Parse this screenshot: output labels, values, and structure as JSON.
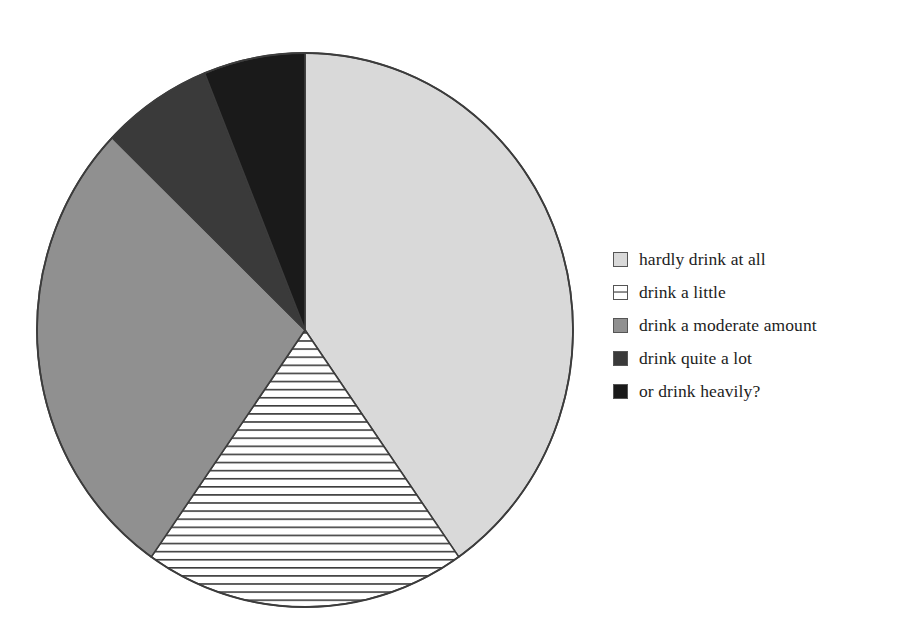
{
  "chart_data": {
    "type": "pie",
    "title": "",
    "subtitle": "",
    "xlabel": "",
    "ylabel": "",
    "grid": false,
    "legend_position": "right",
    "start_angle_deg": 0,
    "direction": "clockwise",
    "categories": [
      "hardly drink at all",
      "drink a little",
      "drink a moderate amount",
      "drink quite a lot",
      "or drink heavily?"
    ],
    "values": [
      40.3,
      19.4,
      27.5,
      6.7,
      6.1
    ],
    "units": "percent",
    "slices": [
      {
        "label": "hardly drink at all",
        "value": 40.3,
        "start_angle_deg": 0,
        "end_angle_deg": 145,
        "fill": "#d9d9d9",
        "pattern": "solid",
        "swatch_name": "legend-swatch-hardly-drink-at-all"
      },
      {
        "label": "drink a little",
        "value": 19.4,
        "start_angle_deg": 145,
        "end_angle_deg": 215,
        "fill": "#ffffff",
        "pattern": "horizontal-lines",
        "swatch_name": "legend-swatch-drink-a-little"
      },
      {
        "label": "drink a moderate amount",
        "value": 27.5,
        "start_angle_deg": 215,
        "end_angle_deg": 314,
        "fill": "#909090",
        "pattern": "solid",
        "swatch_name": "legend-swatch-drink-a-moderate-amount"
      },
      {
        "label": "drink quite a lot",
        "value": 6.7,
        "start_angle_deg": 314,
        "end_angle_deg": 338,
        "fill": "#3a3a3a",
        "pattern": "solid",
        "swatch_name": "legend-swatch-drink-quite-a-lot"
      },
      {
        "label": "or drink heavily?",
        "value": 6.1,
        "start_angle_deg": 338,
        "end_angle_deg": 360,
        "fill": "#1a1a1a",
        "pattern": "solid",
        "swatch_name": "legend-swatch-or-drink-heavily"
      }
    ],
    "colors": {
      "slice_1": "#d9d9d9",
      "slice_2": "#ffffff",
      "slice_3": "#909090",
      "slice_4": "#3a3a3a",
      "slice_5": "#1a1a1a",
      "outline": "#3c3c3c",
      "hatch_line": "#3c3c3c",
      "background": "#ffffff",
      "text": "#1d1d1d"
    }
  },
  "legend": {
    "items": [
      {
        "label": "hardly drink at all"
      },
      {
        "label": "drink a little"
      },
      {
        "label": "drink a moderate amount"
      },
      {
        "label": "drink quite a lot"
      },
      {
        "label": "or drink heavily?"
      }
    ]
  }
}
